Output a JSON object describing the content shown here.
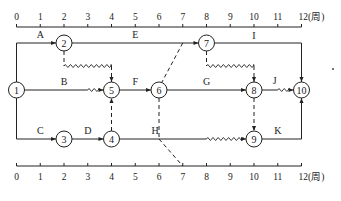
{
  "diagram": {
    "type": "time-scaled network (double-code timescale network plan)",
    "time_axis": {
      "unit_label": "(周)",
      "ticks": [
        "0",
        "1",
        "2",
        "3",
        "4",
        "5",
        "6",
        "7",
        "8",
        "9",
        "10",
        "11",
        "12"
      ]
    },
    "nodes": [
      {
        "id": "1",
        "label": "1",
        "time": 0,
        "row": 1
      },
      {
        "id": "2",
        "label": "2",
        "time": 2,
        "row": 0
      },
      {
        "id": "3",
        "label": "3",
        "time": 2,
        "row": 2
      },
      {
        "id": "4",
        "label": "4",
        "time": 4,
        "row": 2
      },
      {
        "id": "5",
        "label": "5",
        "time": 4,
        "row": 1
      },
      {
        "id": "6",
        "label": "6",
        "time": 6,
        "row": 1
      },
      {
        "id": "7",
        "label": "7",
        "time": 8,
        "row": 0
      },
      {
        "id": "8",
        "label": "8",
        "time": 10,
        "row": 1
      },
      {
        "id": "9",
        "label": "9",
        "time": 10,
        "row": 2
      },
      {
        "id": "10",
        "label": "10",
        "time": 12,
        "row": 1
      }
    ],
    "activities": [
      {
        "name": "A",
        "from": "1",
        "to": "2",
        "duration": 2,
        "free_float": 0
      },
      {
        "name": "B",
        "from": "1",
        "to": "5",
        "duration": 3,
        "free_float": 1
      },
      {
        "name": "C",
        "from": "1",
        "to": "3",
        "duration": 2,
        "free_float": 0
      },
      {
        "name": "D",
        "from": "3",
        "to": "4",
        "duration": 2,
        "free_float": 0
      },
      {
        "name": "E",
        "from": "2",
        "to": "7",
        "duration": 6,
        "free_float": 0
      },
      {
        "name": "F",
        "from": "5",
        "to": "6",
        "duration": 2,
        "free_float": 0
      },
      {
        "name": "G",
        "from": "6",
        "to": "8",
        "duration": 4,
        "free_float": 0
      },
      {
        "name": "H",
        "from": "4",
        "to": "9",
        "duration": 4,
        "free_float": 2
      },
      {
        "name": "I",
        "from": "7",
        "to": "10",
        "duration": 4,
        "free_float": 0
      },
      {
        "name": "J",
        "from": "8",
        "to": "10",
        "duration": 1,
        "free_float": 1
      },
      {
        "name": "K",
        "from": "9",
        "to": "10",
        "duration": 2,
        "free_float": 0
      }
    ],
    "dummy_activities": [
      {
        "from": "2",
        "to": "5",
        "free_float": 2
      },
      {
        "from": "4",
        "to": "5",
        "free_float": 0
      },
      {
        "from": "7",
        "to": "8",
        "free_float": 2
      },
      {
        "from": "8",
        "to": "9",
        "free_float": 0
      }
    ],
    "check_line": {
      "description": "dashed inspection line",
      "points_time": [
        7,
        6,
        6,
        7
      ]
    }
  }
}
